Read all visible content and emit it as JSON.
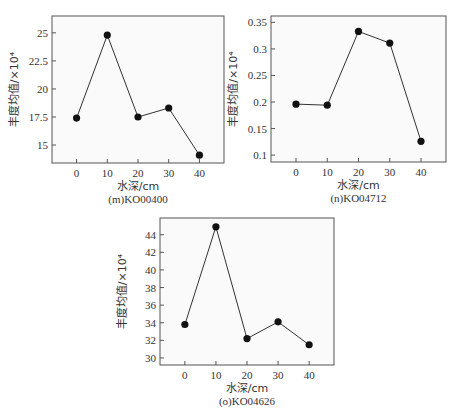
{
  "chart_data": [
    {
      "type": "line",
      "title": "(m)KO00400",
      "xlabel": "水深/cm",
      "ylabel": "丰度均值/×10⁴",
      "x": [
        0,
        10,
        20,
        30,
        40
      ],
      "values": [
        17.4,
        24.8,
        17.5,
        18.3,
        14.1
      ],
      "xticks": [
        "0",
        "10",
        "20",
        "30",
        "40"
      ],
      "yticks": [
        "15",
        "17.5",
        "20",
        "22.5",
        "25"
      ],
      "ylim": [
        13.4,
        26.5
      ],
      "xlim": [
        -8,
        48
      ],
      "grid": false,
      "legend": null
    },
    {
      "type": "line",
      "title": "(n)KO04712",
      "xlabel": "水深/cm",
      "ylabel": "丰度均值/×10⁴",
      "x": [
        0,
        10,
        20,
        30,
        40
      ],
      "values": [
        0.196,
        0.194,
        0.333,
        0.311,
        0.126
      ],
      "xticks": [
        "0",
        "10",
        "20",
        "30",
        "40"
      ],
      "yticks": [
        "0.1",
        "0.15",
        "0.2",
        "0.25",
        "0.3",
        "0.35"
      ],
      "ylim": [
        0.087,
        0.362
      ],
      "xlim": [
        -8,
        48
      ],
      "grid": false,
      "legend": null
    },
    {
      "type": "line",
      "title": "(o)KO04626",
      "xlabel": "水深/cm",
      "ylabel": "丰度均值/×10⁴",
      "x": [
        0,
        10,
        20,
        30,
        40
      ],
      "values": [
        33.8,
        44.9,
        32.2,
        34.1,
        31.5
      ],
      "xticks": [
        "0",
        "10",
        "20",
        "30",
        "40"
      ],
      "yticks": [
        "30",
        "32",
        "34",
        "36",
        "38",
        "40",
        "42",
        "44"
      ],
      "ylim": [
        29.2,
        45.9
      ],
      "xlim": [
        -8,
        48
      ],
      "grid": false,
      "legend": null
    }
  ],
  "layout": [
    {
      "frame": [
        52,
        16,
        224,
        163
      ]
    },
    {
      "frame": [
        271,
        16,
        446,
        162
      ]
    },
    {
      "frame": [
        160,
        218,
        334,
        365
      ]
    }
  ]
}
